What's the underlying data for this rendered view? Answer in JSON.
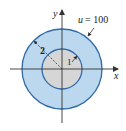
{
  "diagram": {
    "x_axis_label": "x",
    "y_axis_label": "y",
    "boundary_label": "u = 100",
    "boundary_var": "u",
    "boundary_eq": "= 100",
    "outer_radius_label": "2",
    "inner_radius_label": "1",
    "colors": {
      "outer_fill": "#bcd8ef",
      "inner_fill": "#d6d6d6",
      "circle_stroke": "#2f6aa8",
      "axis": "#333333"
    }
  }
}
